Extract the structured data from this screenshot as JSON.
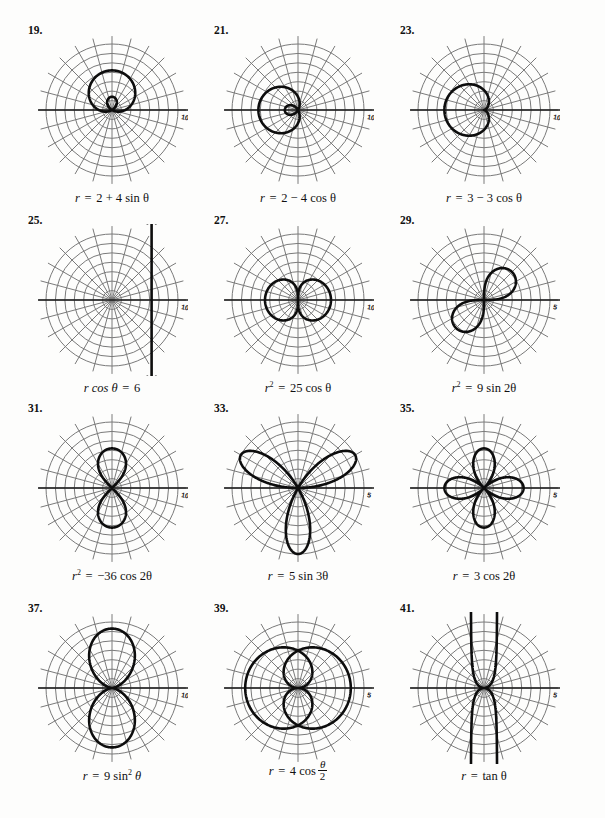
{
  "page": {
    "background": "#fdfdfc",
    "curve_color": "#0d0d0d",
    "grid_color": "#7a7a7a",
    "axis_color": "#1a1a1a"
  },
  "chart_data": {
    "type": "line",
    "note": "Grid of twelve polar plots, each on a polar grid with concentric circles and radial spokes every 15 degrees. The polar axis is labelled 0 at its right end and the outer radial tick is labelled.",
    "plots": [
      {
        "number": "19.",
        "equation_plain": "r = 2 + 4 sin θ",
        "equation_parts": {
          "lhs": "r",
          "eq": "=",
          "rhs": "2 + 4 sin θ"
        },
        "curve_type": "limacon-with-inner-loop",
        "param_a": 2,
        "param_b": 4,
        "trig": "sin",
        "orientation": "up",
        "axis_label_right": "0",
        "radial_tick_label": "10",
        "grid_circles": 7,
        "grid_spokes": 12,
        "r_max": 10
      },
      {
        "number": "21.",
        "equation_plain": "r = 2 − 4 cos θ",
        "equation_parts": {
          "lhs": "r",
          "eq": "=",
          "rhs": "2 − 4 cos θ"
        },
        "curve_type": "limacon-with-inner-loop",
        "param_a": 2,
        "param_b": -4,
        "trig": "cos",
        "orientation": "left",
        "axis_label_right": "0",
        "radial_tick_label": "10",
        "grid_circles": 7,
        "grid_spokes": 12,
        "r_max": 10
      },
      {
        "number": "23.",
        "equation_plain": "r = 3 − 3 cos θ",
        "equation_parts": {
          "lhs": "r",
          "eq": "=",
          "rhs": "3 − 3 cos θ"
        },
        "curve_type": "cardioid",
        "param_a": 3,
        "param_b": -3,
        "trig": "cos",
        "orientation": "left",
        "axis_label_right": "0",
        "radial_tick_label": "10",
        "grid_circles": 7,
        "grid_spokes": 12,
        "r_max": 10
      },
      {
        "number": "25.",
        "equation_plain": "r cos θ = 6",
        "equation_parts": {
          "lhs": "r cos θ",
          "eq": "=",
          "rhs": "6"
        },
        "curve_type": "vertical-line",
        "x_value": 6,
        "arrows": "both-ends",
        "axis_label_right": "0",
        "radial_tick_label": "10",
        "grid_circles": 7,
        "grid_spokes": 12,
        "r_max": 10
      },
      {
        "number": "27.",
        "equation_plain": "r² = 25 cos θ",
        "equation_parts": {
          "lhs": "r",
          "sup": "2",
          "eq": "=",
          "rhs": "25 cos θ"
        },
        "curve_type": "lemniscate-horizontal",
        "param_a2": 25,
        "trig": "cos",
        "axis_label_right": "0",
        "radial_tick_label": "10",
        "grid_circles": 7,
        "grid_spokes": 12,
        "r_max": 10
      },
      {
        "number": "29.",
        "equation_plain": "r² = 9 sin 2θ",
        "equation_parts": {
          "lhs": "r",
          "sup": "2",
          "eq": "=",
          "rhs": "9 sin 2θ"
        },
        "curve_type": "lemniscate-diagonal",
        "param_a2": 9,
        "trig": "sin2",
        "axis_label_right": "0",
        "radial_tick_label": "5",
        "grid_circles": 7,
        "grid_spokes": 12,
        "r_max": 5
      },
      {
        "number": "31.",
        "equation_plain": "r² = −36 cos 2θ",
        "equation_parts": {
          "lhs": "r",
          "sup": "2",
          "eq": "=",
          "rhs": "−36 cos 2θ"
        },
        "curve_type": "lemniscate-vertical",
        "param_a2": 36,
        "trig": "cos2neg",
        "axis_label_right": "0",
        "radial_tick_label": "10",
        "grid_circles": 7,
        "grid_spokes": 12,
        "r_max": 10
      },
      {
        "number": "33.",
        "equation_plain": "r = 5 sin 3θ",
        "equation_parts": {
          "lhs": "r",
          "eq": "=",
          "rhs": "5 sin 3θ"
        },
        "curve_type": "rose-3-petal",
        "amplitude": 5,
        "petals": 3,
        "axis_label_right": "0",
        "radial_tick_label": "5",
        "grid_circles": 7,
        "grid_spokes": 12,
        "r_max": 5
      },
      {
        "number": "35.",
        "equation_plain": "r = 3 cos 2θ",
        "equation_parts": {
          "lhs": "r",
          "eq": "=",
          "rhs": "3 cos 2θ"
        },
        "curve_type": "rose-4-petal",
        "amplitude": 3,
        "petals": 4,
        "axis_label_right": "0",
        "radial_tick_label": "5",
        "grid_circles": 7,
        "grid_spokes": 12,
        "r_max": 5
      },
      {
        "number": "37.",
        "equation_plain": "r = 9 sin² θ",
        "equation_parts": {
          "lhs": "r",
          "eq": "=",
          "rhs": "9 sin",
          "sup": "2",
          "tail": "θ"
        },
        "curve_type": "double-lobe-vertical",
        "amplitude": 9,
        "axis_label_right": "0",
        "radial_tick_label": "10",
        "grid_circles": 7,
        "grid_spokes": 12,
        "r_max": 10
      },
      {
        "number": "39.",
        "equation_plain": "r = 4 cos (θ/2)",
        "equation_parts": {
          "lhs": "r",
          "eq": "=",
          "rhs": "4 cos",
          "frac_top": "θ",
          "frac_bot": "2"
        },
        "curve_type": "cos-half-theta",
        "amplitude": 4,
        "axis_label_right": "0",
        "radial_tick_label": "5",
        "grid_circles": 7,
        "grid_spokes": 12,
        "r_max": 5
      },
      {
        "number": "41.",
        "equation_plain": "r = tan θ",
        "equation_parts": {
          "lhs": "r",
          "eq": "=",
          "rhs": "tan θ"
        },
        "curve_type": "kappa-curve",
        "arrows": "four-ends",
        "axis_label_right": "0",
        "radial_tick_label": "5",
        "grid_circles": 7,
        "grid_spokes": 12,
        "r_max": 5
      }
    ]
  }
}
